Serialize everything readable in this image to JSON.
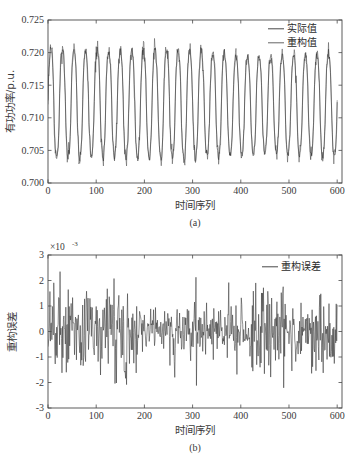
{
  "figure": {
    "background": "#ffffff",
    "ink_color": "#3a3a3a"
  },
  "chart_data": [
    {
      "id": "panel-a",
      "type": "line",
      "title": "",
      "subcaption": "(a)",
      "xlabel": "时间序列",
      "ylabel": "有功功率/p.u.",
      "xlim": [
        0,
        610
      ],
      "ylim": [
        0.7,
        0.725
      ],
      "xticks": [
        0,
        100,
        200,
        300,
        400,
        500,
        600
      ],
      "xtick_labels": [
        "0",
        "100",
        "200",
        "300",
        "400",
        "500",
        "600"
      ],
      "yticks": [
        0.7,
        0.705,
        0.71,
        0.715,
        0.72,
        0.725
      ],
      "ytick_labels": [
        "0.700",
        "0.705",
        "0.710",
        "0.715",
        "0.720",
        "0.725"
      ],
      "grid": false,
      "legend_position": "top-right",
      "legend": [
        {
          "label": "实际值",
          "color": "#333333"
        },
        {
          "label": "重构值",
          "color": "#555555"
        }
      ],
      "waveform": {
        "description": "oscillating active power, ~25 cycles over 600 samples",
        "period": 24,
        "baseline": 0.7125,
        "amplitude_peak": 0.0075,
        "amplitude_trough": 0.0085,
        "sample_count": 601,
        "peak_typical": 0.7197,
        "trough_typical": 0.7042,
        "peak_max": 0.7212,
        "trough_min": 0.7028
      }
    },
    {
      "id": "panel-b",
      "type": "line",
      "title": "",
      "subcaption": "(b)",
      "xlabel": "时间序列",
      "ylabel": "重构误差",
      "exponent_prefix": "×10",
      "exponent_power": "-3",
      "xlim": [
        0,
        610
      ],
      "ylim": [
        -3,
        3
      ],
      "xticks": [
        0,
        100,
        200,
        300,
        400,
        500,
        600
      ],
      "xtick_labels": [
        "0",
        "100",
        "200",
        "300",
        "400",
        "500",
        "600"
      ],
      "yticks": [
        -3,
        -2,
        -1,
        0,
        1,
        2,
        3
      ],
      "ytick_labels": [
        "-3",
        "-2",
        "-1",
        "0",
        "1",
        "2",
        "3"
      ],
      "grid": false,
      "legend_position": "top-right",
      "legend": [
        {
          "label": "重构误差",
          "color": "#333333"
        }
      ],
      "waveform": {
        "description": "high frequency reconstruction error noise",
        "sample_count": 601,
        "mean": 0.0,
        "std_dev": 0.75,
        "typical_range": [
          -1.6,
          1.6
        ],
        "max_spike": 2.9,
        "min_spike": -2.8
      }
    }
  ]
}
